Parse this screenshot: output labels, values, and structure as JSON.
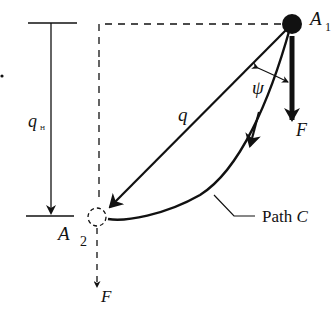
{
  "diagram": {
    "labels": {
      "start_point": "A",
      "start_point_sub": "1",
      "end_point": "A",
      "end_point_sub": "2",
      "displacement": "q",
      "height": "q",
      "height_sub": "H",
      "angle": "ψ",
      "force_top": "F",
      "force_bottom": "F",
      "path": "Path ",
      "path_name": "C"
    },
    "colors": {
      "ink": "#111111",
      "background": "#ffffff"
    }
  }
}
